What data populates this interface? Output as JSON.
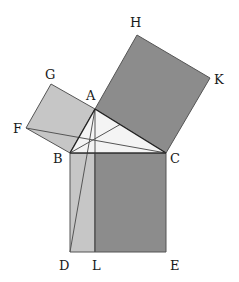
{
  "colors": {
    "light_fill": "#c6c6c6",
    "dark_fill": "#8c8c8c",
    "triangle_fill": "#f4f4f4",
    "stroke": "#555555",
    "stroke_dark": "#222222"
  },
  "points": {
    "A": [
      95,
      109
    ],
    "B": [
      70,
      153
    ],
    "C": [
      166,
      153
    ],
    "D": [
      70,
      252
    ],
    "L": [
      95,
      252
    ],
    "E": [
      166,
      252
    ],
    "F": [
      26,
      128
    ],
    "G": [
      51,
      84
    ],
    "H": [
      137,
      35
    ],
    "K": [
      210,
      78
    ]
  },
  "labels": {
    "A": {
      "text": "A",
      "x": 86,
      "y": 100
    },
    "B": {
      "text": "B",
      "x": 53,
      "y": 163
    },
    "C": {
      "text": "C",
      "x": 170,
      "y": 163
    },
    "D": {
      "text": "D",
      "x": 59,
      "y": 270
    },
    "L": {
      "text": "L",
      "x": 92,
      "y": 270
    },
    "E": {
      "text": "E",
      "x": 170,
      "y": 270
    },
    "F": {
      "text": "F",
      "x": 13,
      "y": 133
    },
    "G": {
      "text": "G",
      "x": 45,
      "y": 79
    },
    "H": {
      "text": "H",
      "x": 130,
      "y": 27
    },
    "K": {
      "text": "K",
      "x": 214,
      "y": 84
    }
  },
  "shapes": {
    "square_AB": "ABFG",
    "square_AC": "ACKH",
    "square_BC": "BCED",
    "rect_BDL": "BDL(M)",
    "rect_LCE": "LCE(M)"
  },
  "lines": [
    "AL",
    "AD",
    "FC",
    "BK"
  ]
}
